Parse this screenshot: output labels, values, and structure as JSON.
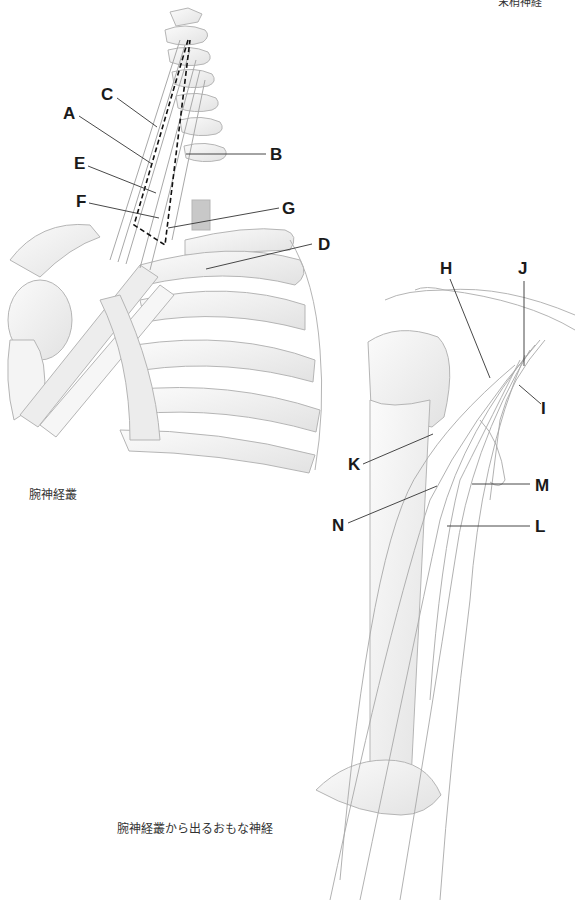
{
  "header": {
    "clipped_title": "末梢神経"
  },
  "figure1": {
    "caption": "腕神経叢",
    "labels": {
      "A": "A",
      "B": "B",
      "C": "C",
      "D": "D",
      "E": "E",
      "F": "F",
      "G": "G"
    }
  },
  "figure2": {
    "caption": "腕神経叢から出るおもな神経",
    "labels": {
      "H": "H",
      "I": "I",
      "J": "J",
      "K": "K",
      "L": "L",
      "M": "M",
      "N": "N"
    }
  },
  "colors": {
    "background": "#ffffff",
    "label_text": "#1a1a1a",
    "leader_line": "#333333",
    "bone_fill": "#f2f2f2",
    "bone_stroke": "#b5b5b5",
    "nerve_stroke": "#a8a8a8"
  }
}
